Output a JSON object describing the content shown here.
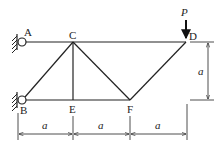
{
  "diagram": {
    "type": "truss",
    "nodes": {
      "A": {
        "label": "A"
      },
      "B": {
        "label": "B"
      },
      "C": {
        "label": "C"
      },
      "D": {
        "label": "D"
      },
      "E": {
        "label": "E"
      },
      "F": {
        "label": "F"
      }
    },
    "members": [
      "AC",
      "CD",
      "BE",
      "EF",
      "BC",
      "CE",
      "CF",
      "FD"
    ],
    "supports": [
      "A",
      "B"
    ],
    "load": {
      "node": "D",
      "label": "P",
      "direction": "down"
    },
    "dimensions": {
      "horizontal": [
        "a",
        "a",
        "a"
      ],
      "vertical": "a"
    }
  }
}
